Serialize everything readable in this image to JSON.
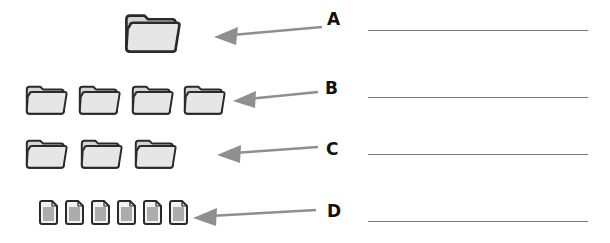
{
  "worksheet": {
    "rows": [
      {
        "label": "A",
        "icon_type": "folder-icon",
        "icon_count": 1
      },
      {
        "label": "B",
        "icon_type": "folder-icon",
        "icon_count": 4
      },
      {
        "label": "C",
        "icon_type": "folder-icon",
        "icon_count": 3
      },
      {
        "label": "D",
        "icon_type": "document-icon",
        "icon_count": 6
      }
    ]
  },
  "colors": {
    "icon_fill": "#e3e3e3",
    "icon_stroke": "#2a2a2a",
    "arrow": "#8f8f8f",
    "answer_line": "#7a7a7a",
    "letter": "#111111"
  }
}
